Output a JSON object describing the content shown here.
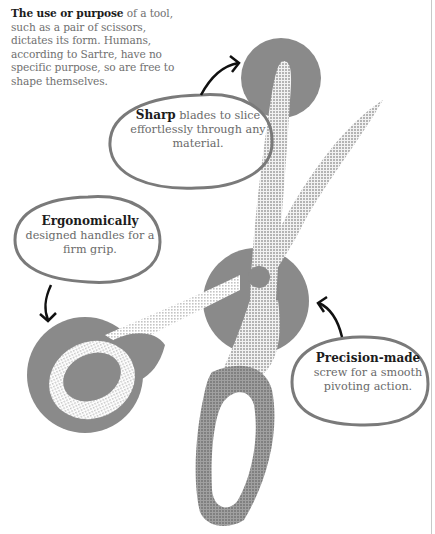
{
  "intro": {
    "bold": "The use or purpose",
    "text": " of a tool, such as a pair of scissors, dictates its form. Humans, according to Sartre, have no specific purpose, so are free to shape themselves."
  },
  "callouts": [
    {
      "id": "sharp",
      "bold": "Sharp",
      "text": " blades to slice effortlessly through any material."
    },
    {
      "id": "ergonomic",
      "bold": "Ergonomically",
      "text": " designed handles for a firm grip."
    },
    {
      "id": "precision",
      "bold": "Precision-made",
      "text": " screw for a smooth pivoting action."
    }
  ],
  "illustration": {
    "subject": "pair of scissors",
    "highlight_circles": [
      "blade-tip",
      "pivot-screw",
      "handle"
    ],
    "colors": {
      "circle": "#8a8a8a",
      "blade": "#c9c9c9",
      "handle": "#8f8f8f",
      "bubble_outline": "#7a7a7a",
      "arrow": "#111111"
    }
  }
}
